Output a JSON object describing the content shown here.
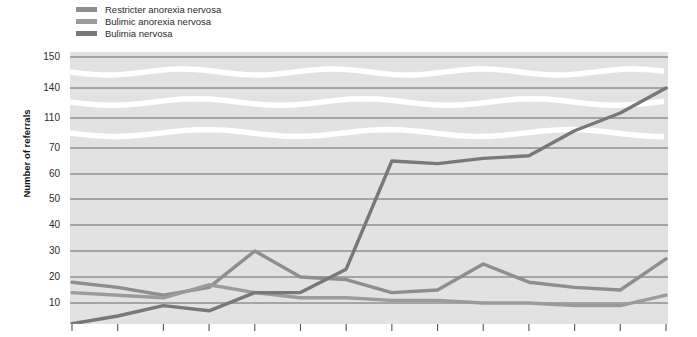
{
  "chart_data": {
    "type": "line",
    "title": "",
    "subtitle": "",
    "xlabel": "",
    "ylabel": "Number of referrals",
    "grid": true,
    "legend_position": "top-left",
    "axis_break": true,
    "axis_break_note": "Y axis is broken/compressed above 70; wavy white bands mark the breaks",
    "ytick_labels": [
      "150",
      "140",
      "110",
      "70",
      "60",
      "50",
      "40",
      "30",
      "20",
      "10"
    ],
    "ytick_values": [
      150,
      140,
      110,
      70,
      60,
      50,
      40,
      30,
      20,
      10
    ],
    "ylim": [
      0,
      150
    ],
    "x": [
      1,
      2,
      3,
      4,
      5,
      6,
      7,
      8,
      9,
      10,
      11,
      12,
      13,
      14
    ],
    "series": [
      {
        "name": "Restricter anorexia nervosa",
        "color": "#8e8e8e",
        "values": [
          18,
          16,
          13,
          16,
          30,
          20,
          19,
          14,
          15,
          25,
          18,
          16,
          15,
          27
        ]
      },
      {
        "name": "Bulimic anorexia nervosa",
        "color": "#9b9b9b",
        "values": [
          14,
          13,
          12,
          17,
          14,
          12,
          12,
          11,
          11,
          10,
          10,
          9,
          9,
          13
        ]
      },
      {
        "name": "Bulimia nervosa",
        "color": "#787878",
        "values": [
          2,
          5,
          9,
          7,
          14,
          14,
          23,
          65,
          64,
          66,
          67,
          93,
          115,
          140
        ]
      }
    ]
  },
  "legend": {
    "items": [
      {
        "label": "Restricter anorexia nervosa",
        "color": "#8e8e8e"
      },
      {
        "label": "Bulimic anorexia nervosa",
        "color": "#9b9b9b"
      },
      {
        "label": "Bulimia nervosa",
        "color": "#787878"
      }
    ]
  },
  "axis": {
    "y_title": "Number of referrals",
    "ticks": [
      {
        "label": "150",
        "y": 57
      },
      {
        "label": "140",
        "y": 88
      },
      {
        "label": "110",
        "y": 118
      },
      {
        "label": "70",
        "y": 148
      },
      {
        "label": "60",
        "y": 174
      },
      {
        "label": "50",
        "y": 199
      },
      {
        "label": "40",
        "y": 225
      },
      {
        "label": "30",
        "y": 251
      },
      {
        "label": "20",
        "y": 277
      },
      {
        "label": "10",
        "y": 303
      }
    ]
  },
  "style": {
    "plot_background": "#e2e2e2",
    "gridline_color": "#595959",
    "break_band_color": "#ffffff",
    "tick_color": "#555555"
  }
}
